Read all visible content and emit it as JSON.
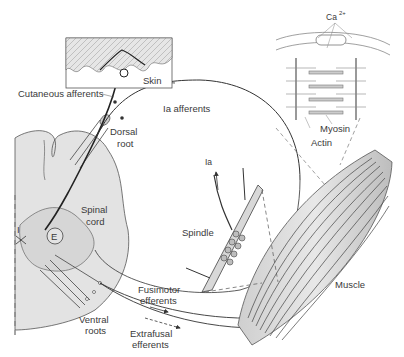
{
  "diagram": {
    "colors": {
      "background": "#ffffff",
      "tissue_fill": "#e3e3e3",
      "skin_fill": "#d6d6d6",
      "line": "#333333",
      "label": "#3a3a3a"
    },
    "labels": {
      "ca": "Ca",
      "ca_sup": "2+",
      "skin": "Skin",
      "cutaneous_afferents": "Cutaneous afferents",
      "ia_afferents": "Ia afferents",
      "dorsal_line1": "Dorsal",
      "dorsal_line2": "root",
      "myosin": "Myosin",
      "actin": "Actin",
      "spinal_line1": "Spinal",
      "spinal_line2": "cord",
      "interneuron_i": "I",
      "interneuron_e": "E",
      "ia": "Ia",
      "spindle": "Spindle",
      "muscle": "Muscle",
      "fusimotor_line1": "Fusimotor",
      "fusimotor_line2": "efferents",
      "ventral_line1": "Ventral",
      "ventral_line2": "roots",
      "extrafusal_line1": "Extrafusal",
      "extrafusal_line2": "efferents"
    }
  }
}
